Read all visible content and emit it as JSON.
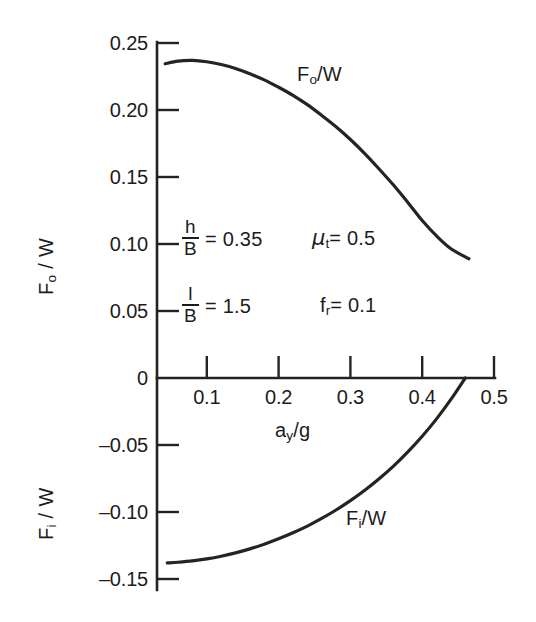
{
  "chart_data": {
    "type": "line",
    "title": "",
    "xlabel": "a_y/g",
    "ylabel_upper": "F_o / W",
    "ylabel_lower": "F_i / W",
    "xlim": [
      0.0,
      0.5
    ],
    "ylim": [
      -0.15,
      0.25
    ],
    "grid": false,
    "legend": "none",
    "xticks": [
      0.1,
      0.2,
      0.3,
      0.4,
      0.5
    ],
    "xtick_labels": [
      "0.1",
      "0.2",
      "0.3",
      "0.4",
      "0.5"
    ],
    "yticks": [
      0.25,
      0.2,
      0.15,
      0.1,
      0.05,
      0,
      -0.05,
      -0.1,
      -0.15
    ],
    "ytick_labels": [
      "0.25",
      "0.20",
      "0.15",
      "0.10",
      "0.05",
      "0",
      "–0.05",
      "–0.10",
      "–0.15"
    ],
    "series": [
      {
        "name": "F_o/W",
        "label": "F_o/W",
        "x": [
          0.042,
          0.06,
          0.08,
          0.1,
          0.12,
          0.14,
          0.16,
          0.18,
          0.2,
          0.22,
          0.24,
          0.26,
          0.28,
          0.3,
          0.32,
          0.34,
          0.36,
          0.38,
          0.4,
          0.42,
          0.44,
          0.465
        ],
        "values": [
          0.2345,
          0.2365,
          0.237,
          0.236,
          0.234,
          0.231,
          0.227,
          0.2225,
          0.217,
          0.211,
          0.204,
          0.196,
          0.1875,
          0.178,
          0.1675,
          0.156,
          0.144,
          0.131,
          0.1175,
          0.106,
          0.0965,
          0.089
        ]
      },
      {
        "name": "F_i/W",
        "label": "F_i/W",
        "x": [
          0.045,
          0.06,
          0.08,
          0.1,
          0.12,
          0.14,
          0.16,
          0.18,
          0.2,
          0.22,
          0.24,
          0.26,
          0.28,
          0.3,
          0.32,
          0.34,
          0.36,
          0.38,
          0.4,
          0.42,
          0.44,
          0.46
        ],
        "values": [
          -0.138,
          -0.1375,
          -0.1365,
          -0.135,
          -0.133,
          -0.1305,
          -0.1275,
          -0.124,
          -0.12,
          -0.1155,
          -0.1105,
          -0.1048,
          -0.0985,
          -0.0915,
          -0.0838,
          -0.0752,
          -0.0658,
          -0.0552,
          -0.0435,
          -0.0305,
          -0.016,
          0.0
        ]
      }
    ],
    "annotations": [
      {
        "id": "h-over-B",
        "numerator": "h",
        "denominator": "B",
        "equals": "=",
        "value": "0.35"
      },
      {
        "id": "l-over-B",
        "numerator": "l",
        "denominator": "B",
        "equals": "=",
        "value": "1.5"
      },
      {
        "id": "mu-t",
        "symbol": "μ",
        "subscript": "t",
        "equals": "=",
        "value": "0.5"
      },
      {
        "id": "f-r",
        "symbol": "f",
        "subscript": "r",
        "equals": "=",
        "value": "0.1"
      }
    ]
  },
  "axes": {
    "x_title_base": "a",
    "x_title_sub": "y",
    "x_title_tail": "/g",
    "y_upper_base": "F",
    "y_upper_sub": "o",
    "y_upper_tail": " / W",
    "y_lower_base": "F",
    "y_lower_sub": "i",
    "y_lower_tail": " / W"
  },
  "curve_labels": {
    "upper_base": "F",
    "upper_sub": "o",
    "upper_tail": "/W",
    "lower_base": "F",
    "lower_sub": "i",
    "lower_tail": "/W"
  },
  "style": {
    "ink": "#232323",
    "background": "#ffffff"
  }
}
